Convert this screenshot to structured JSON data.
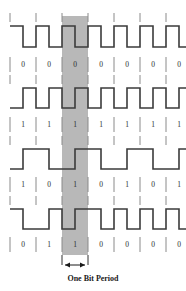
{
  "figure": {
    "title": "",
    "width": 186,
    "height": 291,
    "caption": "One Bit Period",
    "colors": {
      "background": "#ffffff",
      "waveform": "#3b3b3b",
      "tick": "#8a8a8a",
      "highlight_band": "#b8b8b8",
      "label_text": "#2b2b2b",
      "caption_text": "#1a1a1a"
    }
  },
  "chart_data": {
    "type": "line",
    "title": "",
    "subtitle": "",
    "xlabel": "",
    "ylabel": "",
    "grid": false,
    "legend_position": "none",
    "annotations": [
      {
        "name": "one-bit-period",
        "text": "One Bit Period",
        "bit_index": 2,
        "x_start": 62,
        "x_end": 88
      }
    ],
    "encoding": "manchester",
    "bit_count": 7,
    "bit_period_px": 26,
    "x_origin": 10,
    "series": [
      {
        "name": "row-1",
        "bits": [
          "0",
          "0",
          "0",
          "0",
          "0",
          "0",
          "0"
        ],
        "levels": [
          [
            1,
            0
          ],
          [
            1,
            0
          ],
          [
            1,
            0
          ],
          [
            1,
            0
          ],
          [
            1,
            0
          ],
          [
            1,
            0
          ],
          [
            1,
            0
          ]
        ]
      },
      {
        "name": "row-2",
        "bits": [
          "1",
          "1",
          "1",
          "1",
          "1",
          "1",
          "1"
        ],
        "levels": [
          [
            0,
            1
          ],
          [
            0,
            1
          ],
          [
            0,
            1
          ],
          [
            0,
            1
          ],
          [
            0,
            1
          ],
          [
            0,
            1
          ],
          [
            0,
            1
          ]
        ]
      },
      {
        "name": "row-3",
        "bits": [
          "1",
          "0",
          "1",
          "0",
          "1",
          "0",
          "1"
        ],
        "levels": [
          [
            0,
            1
          ],
          [
            1,
            0
          ],
          [
            0,
            1
          ],
          [
            1,
            0
          ],
          [
            0,
            1
          ],
          [
            1,
            0
          ],
          [
            0,
            1
          ]
        ]
      },
      {
        "name": "row-4",
        "bits": [
          "0",
          "1",
          "1",
          "0",
          "0",
          "0",
          "0"
        ],
        "levels": [
          [
            1,
            0
          ],
          [
            0,
            1
          ],
          [
            0,
            1
          ],
          [
            1,
            0
          ],
          [
            1,
            0
          ],
          [
            1,
            0
          ],
          [
            1,
            0
          ]
        ]
      }
    ]
  }
}
